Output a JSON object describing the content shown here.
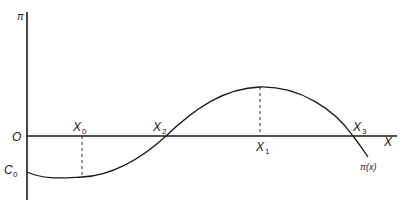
{
  "diagram": {
    "y_axis_label": "π",
    "x_axis_label": "X",
    "origin_label": "O",
    "intercept_label": {
      "main": "C",
      "sub": "0"
    },
    "curve_label": "π(x)",
    "points": [
      {
        "main": "X",
        "sub": "0",
        "role": "minimum"
      },
      {
        "main": "X",
        "sub": "2",
        "role": "zero crossing"
      },
      {
        "main": "X",
        "sub": "1",
        "role": "maximum"
      },
      {
        "main": "X",
        "sub": "3",
        "role": "zero crossing"
      }
    ],
    "colors": {
      "line": "#1a1a1a",
      "background": "#ffffff"
    }
  }
}
